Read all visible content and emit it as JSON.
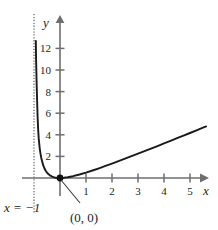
{
  "chart_data": {
    "type": "line",
    "title": "",
    "xlabel": "x",
    "ylabel": "y",
    "xlim": [
      -1.6,
      6.0
    ],
    "ylim": [
      -1.2,
      14.2
    ],
    "grid": false,
    "legend": null,
    "x_ticks": [
      "1",
      "2",
      "3",
      "4",
      "5"
    ],
    "x_tick_values": [
      1,
      2,
      3,
      4,
      5
    ],
    "y_ticks": [
      "2",
      "4",
      "6",
      "8",
      "10",
      "12"
    ],
    "y_tick_values": [
      2,
      4,
      6,
      8,
      10,
      12
    ],
    "series": [
      {
        "name": "curve",
        "color": "#1a1a1a",
        "x": [
          -0.93,
          -0.92,
          -0.9,
          -0.88,
          -0.86,
          -0.84,
          -0.82,
          -0.8,
          -0.78,
          -0.75,
          -0.72,
          -0.68,
          -0.64,
          -0.6,
          -0.55,
          -0.5,
          -0.45,
          -0.4,
          -0.35,
          -0.3,
          -0.25,
          -0.2,
          -0.15,
          -0.1,
          -0.05,
          0.0,
          0.15,
          0.3,
          0.5,
          0.75,
          1.0,
          1.25,
          1.5,
          1.75,
          2.0,
          2.25,
          2.5,
          2.75,
          3.0,
          3.25,
          3.5,
          3.75,
          4.0,
          4.25,
          4.5,
          4.75,
          5.0,
          5.25,
          5.5,
          5.62
        ],
        "y": [
          12.7,
          11.0,
          8.9,
          7.1,
          5.6,
          4.5,
          3.7,
          3.2,
          2.75,
          2.25,
          1.85,
          1.47,
          1.14,
          0.9,
          0.67,
          0.5,
          0.37,
          0.27,
          0.188,
          0.129,
          0.083,
          0.05,
          0.026,
          0.011,
          0.0026,
          0.0,
          0.0196,
          0.069,
          0.167,
          0.321,
          0.5,
          0.694,
          0.9,
          1.114,
          1.333,
          1.558,
          1.786,
          2.017,
          2.25,
          2.485,
          2.722,
          2.961,
          3.2,
          3.44,
          3.682,
          3.924,
          4.167,
          4.41,
          4.654,
          4.77
        ],
        "note": "curve with vertical asymptote at x = -1, minimum at origin, rising through the first quadrant"
      }
    ],
    "asymptote": {
      "label": "x = −1",
      "x_value": -1,
      "style": "dotted",
      "color": "#8a8a8a"
    },
    "annotations": [
      {
        "id": "origin-point",
        "label": "(0, 0)",
        "x": 0,
        "y": 0,
        "marker": "filled-dot",
        "leader_line": true
      }
    ]
  },
  "labels": {
    "x_axis": "x",
    "y_axis": "y",
    "asymptote": "x = −1",
    "origin": "(0, 0)"
  },
  "colors": {
    "background": "#ffffff",
    "axis": "#6e6e6e",
    "curve": "#1a1a1a",
    "asymptote": "#9a9a9a",
    "text": "#242424"
  }
}
